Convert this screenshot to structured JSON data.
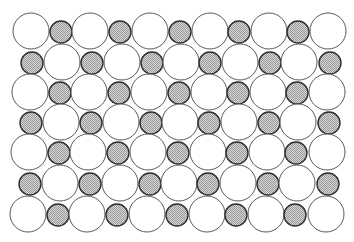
{
  "diagram": {
    "colors": {
      "background": "#ffffff",
      "large_fill": "#ffffff",
      "large_stroke": "#5a5a5a",
      "small_fill_light": "#d6d6d6",
      "small_fill_dark": "#9a9a9a",
      "small_stroke": "#2e2e2e"
    },
    "large_radius": 18,
    "small_radius": 11,
    "rows": [
      {
        "y": 31,
        "pattern": [
          "L",
          "S",
          "L",
          "S",
          "L",
          "S",
          "L",
          "S",
          "L",
          "S",
          "L"
        ],
        "x": [
          31,
          61,
          90,
          120,
          150,
          180,
          210,
          239,
          269,
          298,
          328
        ]
      },
      {
        "y": 62,
        "pattern": [
          "S",
          "L",
          "S",
          "L",
          "S",
          "L",
          "S",
          "L",
          "S",
          "L",
          "S"
        ],
        "x": [
          32,
          62,
          92,
          122,
          152,
          181,
          210,
          240,
          270,
          299,
          330
        ]
      },
      {
        "y": 92,
        "pattern": [
          "L",
          "S",
          "L",
          "S",
          "L",
          "S",
          "L",
          "S",
          "L",
          "S",
          "L"
        ],
        "x": [
          30,
          60,
          89,
          119,
          149,
          179,
          209,
          238,
          268,
          297,
          327
        ]
      },
      {
        "y": 122,
        "pattern": [
          "S",
          "L",
          "S",
          "L",
          "S",
          "L",
          "S",
          "L",
          "S",
          "L",
          "S"
        ],
        "x": [
          31,
          61,
          91,
          121,
          151,
          180,
          209,
          239,
          269,
          298,
          329
        ]
      },
      {
        "y": 152,
        "pattern": [
          "L",
          "S",
          "L",
          "S",
          "L",
          "S",
          "L",
          "S",
          "L",
          "S",
          "L"
        ],
        "x": [
          29,
          59,
          88,
          118,
          148,
          178,
          208,
          237,
          267,
          296,
          327
        ]
      },
      {
        "y": 183,
        "pattern": [
          "S",
          "L",
          "S",
          "L",
          "S",
          "L",
          "S",
          "L",
          "S",
          "L",
          "S"
        ],
        "x": [
          30,
          60,
          90,
          120,
          150,
          179,
          208,
          238,
          268,
          297,
          328
        ]
      },
      {
        "y": 214,
        "pattern": [
          "L",
          "S",
          "L",
          "S",
          "L",
          "S",
          "L",
          "S",
          "L",
          "S",
          "L"
        ],
        "x": [
          28,
          58,
          87,
          117,
          147,
          177,
          207,
          236,
          266,
          295,
          326
        ]
      }
    ]
  }
}
